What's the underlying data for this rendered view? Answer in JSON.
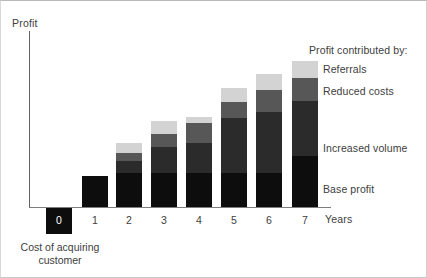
{
  "chart_data": {
    "type": "bar",
    "stacked": true,
    "title": "",
    "xlabel": "Years",
    "ylabel": "Profit",
    "grid": false,
    "legend_position": "right",
    "legend_title": "Profit contributed by:",
    "categories": [
      "0",
      "1",
      "2",
      "3",
      "4",
      "5",
      "6",
      "7"
    ],
    "series": [
      {
        "name": "Base profit",
        "color": "#0d0d0d",
        "values": [
          0,
          31,
          34,
          34,
          34,
          34,
          34,
          51
        ]
      },
      {
        "name": "Increased volume",
        "color": "#2b2b2b",
        "values": [
          0,
          0,
          12,
          26,
          30,
          55,
          61,
          55
        ]
      },
      {
        "name": "Reduced costs",
        "color": "#575757",
        "values": [
          0,
          0,
          8,
          13,
          20,
          16,
          22,
          23
        ]
      },
      {
        "name": "Referrals",
        "color": "#d3d3d3",
        "values": [
          0,
          0,
          10,
          13,
          6,
          14,
          16,
          17
        ]
      }
    ],
    "cost_of_acquiring": {
      "value": -26,
      "label": "0",
      "caption_line1": "Cost of acquiring",
      "caption_line2": "customer",
      "color": "#0d0d0d"
    },
    "axis_color": "#6e6e6e",
    "text_color": "#404040",
    "background": "#ffffff",
    "note": "Values are pixel heights read off the unlabeled y-axis; the axis has no numeric ticks."
  },
  "axes": {
    "y_title": "Profit",
    "x_title": "Years"
  },
  "legend": {
    "title": "Profit contributed by:",
    "items": [
      {
        "label": "Referrals",
        "color": "#d3d3d3",
        "top": 62
      },
      {
        "label": "Reduced costs",
        "color": "#575757",
        "top": 84
      },
      {
        "label": "Increased volume",
        "color": "#2b2b2b",
        "top": 141
      },
      {
        "label": "Base profit",
        "color": "#0d0d0d",
        "top": 182
      }
    ]
  },
  "cost": {
    "label": "0",
    "caption_line1": "Cost of acquiring",
    "caption_line2": "customer"
  },
  "ticks": [
    {
      "label": "1",
      "left": 81
    },
    {
      "label": "2",
      "left": 115
    },
    {
      "label": "3",
      "left": 150
    },
    {
      "label": "4",
      "left": 185
    },
    {
      "label": "5",
      "left": 220
    },
    {
      "label": "6",
      "left": 255
    },
    {
      "label": "7",
      "left": 291
    }
  ],
  "bars": [
    {
      "year": "1",
      "left": 81,
      "segments": [
        {
          "h": 31,
          "c": "#0d0d0d"
        }
      ]
    },
    {
      "year": "2",
      "left": 115,
      "segments": [
        {
          "h": 34,
          "c": "#0d0d0d"
        },
        {
          "h": 12,
          "c": "#2b2b2b"
        },
        {
          "h": 8,
          "c": "#575757"
        },
        {
          "h": 10,
          "c": "#d3d3d3"
        }
      ]
    },
    {
      "year": "3",
      "left": 150,
      "segments": [
        {
          "h": 34,
          "c": "#0d0d0d"
        },
        {
          "h": 26,
          "c": "#2b2b2b"
        },
        {
          "h": 13,
          "c": "#575757"
        },
        {
          "h": 13,
          "c": "#d3d3d3"
        }
      ]
    },
    {
      "year": "4",
      "left": 185,
      "segments": [
        {
          "h": 34,
          "c": "#0d0d0d"
        },
        {
          "h": 30,
          "c": "#2b2b2b"
        },
        {
          "h": 20,
          "c": "#575757"
        },
        {
          "h": 6,
          "c": "#d3d3d3"
        }
      ]
    },
    {
      "year": "5",
      "left": 220,
      "segments": [
        {
          "h": 34,
          "c": "#0d0d0d"
        },
        {
          "h": 55,
          "c": "#2b2b2b"
        },
        {
          "h": 16,
          "c": "#575757"
        },
        {
          "h": 14,
          "c": "#d3d3d3"
        }
      ]
    },
    {
      "year": "6",
      "left": 255,
      "segments": [
        {
          "h": 34,
          "c": "#0d0d0d"
        },
        {
          "h": 61,
          "c": "#2b2b2b"
        },
        {
          "h": 22,
          "c": "#575757"
        },
        {
          "h": 16,
          "c": "#d3d3d3"
        }
      ]
    },
    {
      "year": "7",
      "left": 291,
      "segments": [
        {
          "h": 51,
          "c": "#0d0d0d"
        },
        {
          "h": 55,
          "c": "#2b2b2b"
        },
        {
          "h": 23,
          "c": "#575757"
        },
        {
          "h": 17,
          "c": "#d3d3d3"
        }
      ]
    }
  ]
}
